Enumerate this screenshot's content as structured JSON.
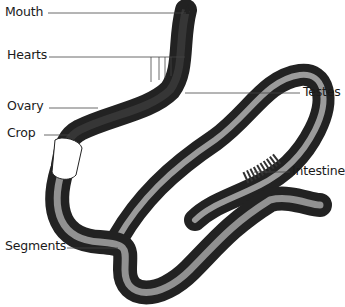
{
  "diagram": {
    "labels": {
      "mouth": "Mouth",
      "hearts": "Hearts",
      "ovary": "Ovary",
      "crop": "Crop",
      "testes": "Testes",
      "intestine": "Intestine",
      "segments": "Segments"
    }
  }
}
